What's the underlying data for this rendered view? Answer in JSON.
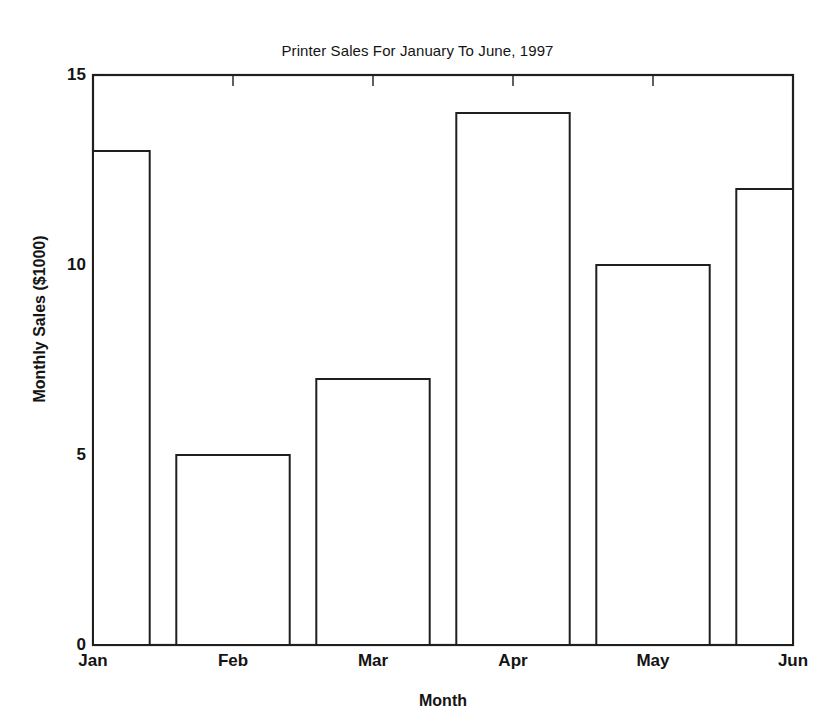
{
  "chart_data": {
    "type": "bar",
    "title": "Printer Sales For January To June, 1997",
    "xlabel": "Month",
    "ylabel": "Monthly Sales ($1000)",
    "categories": [
      "Jan",
      "Feb",
      "Mar",
      "Apr",
      "May",
      "Jun"
    ],
    "values": [
      13,
      5,
      7,
      14,
      10,
      12
    ],
    "yticks": [
      "0",
      "5",
      "10",
      "15"
    ],
    "ytick_values": [
      0,
      5,
      10,
      15
    ],
    "ylim": [
      0,
      15
    ],
    "xtick_labels": [
      "Jan",
      "Feb",
      "Mar",
      "Apr",
      "May",
      "Jun"
    ],
    "grid": "off",
    "legend": "none",
    "bar_fill_color": "#ffffff",
    "bar_edge_color": "#1f1f1f",
    "background_color": "#ffffff"
  }
}
